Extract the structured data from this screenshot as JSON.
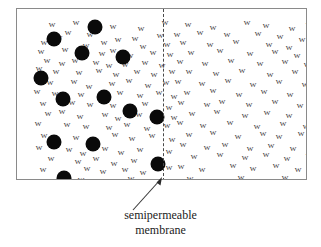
{
  "figure": {
    "name": "osmosis-semipermeable-membrane-diagram",
    "caption_line1": "semipermeable",
    "caption_line2": "membrane",
    "colors": {
      "vessel_border": "#8a8a8a",
      "membrane_line": "#4a4a4a",
      "solute_fill": "#0a0a0a",
      "water_text": "#2b2b2b",
      "background": "#ffffff",
      "caption_text": "#1c1c1c"
    },
    "vessel": {
      "x": 16,
      "y": 8,
      "width": 291,
      "height": 172
    },
    "membrane": {
      "x": 146,
      "style": "dashed",
      "orientation": "vertical"
    },
    "water_label": "W",
    "left_chamber": {
      "label": "concentrated solution side",
      "solute_count": 15,
      "water_count": 75
    },
    "right_chamber": {
      "label": "pure water side",
      "solute_count": 0,
      "water_count": 85
    },
    "solutes": [
      {
        "x": 78,
        "y": 18,
        "r": 7.5
      },
      {
        "x": 37,
        "y": 30,
        "r": 7.5
      },
      {
        "x": 65,
        "y": 44,
        "r": 7.5
      },
      {
        "x": 106,
        "y": 48,
        "r": 7.5
      },
      {
        "x": 24,
        "y": 69,
        "r": 7.5
      },
      {
        "x": 46,
        "y": 90,
        "r": 7.5
      },
      {
        "x": 87,
        "y": 88,
        "r": 7.5
      },
      {
        "x": 113,
        "y": 102,
        "r": 7.5
      },
      {
        "x": 140,
        "y": 108,
        "r": 7.5
      },
      {
        "x": 37,
        "y": 133,
        "r": 7.5
      },
      {
        "x": 76,
        "y": 135,
        "r": 7.5
      },
      {
        "x": 141,
        "y": 155,
        "r": 7.5
      },
      {
        "x": 47,
        "y": 169,
        "r": 7.5
      }
    ],
    "waters_left": [
      {
        "x": 35,
        "y": 16
      },
      {
        "x": 59,
        "y": 14
      },
      {
        "x": 96,
        "y": 18
      },
      {
        "x": 124,
        "y": 20
      },
      {
        "x": 148,
        "y": 14
      },
      {
        "x": 51,
        "y": 24
      },
      {
        "x": 42,
        "y": 29
      },
      {
        "x": 73,
        "y": 26
      },
      {
        "x": 118,
        "y": 30
      },
      {
        "x": 143,
        "y": 27
      },
      {
        "x": 27,
        "y": 34
      },
      {
        "x": 87,
        "y": 34
      },
      {
        "x": 101,
        "y": 31
      },
      {
        "x": 126,
        "y": 38
      },
      {
        "x": 150,
        "y": 36
      },
      {
        "x": 24,
        "y": 43
      },
      {
        "x": 48,
        "y": 41
      },
      {
        "x": 69,
        "y": 37
      },
      {
        "x": 85,
        "y": 45
      },
      {
        "x": 96,
        "y": 42
      },
      {
        "x": 113,
        "y": 47
      },
      {
        "x": 136,
        "y": 44
      },
      {
        "x": 153,
        "y": 46
      },
      {
        "x": 30,
        "y": 52
      },
      {
        "x": 45,
        "y": 55
      },
      {
        "x": 58,
        "y": 52
      },
      {
        "x": 79,
        "y": 54
      },
      {
        "x": 92,
        "y": 57
      },
      {
        "x": 108,
        "y": 56
      },
      {
        "x": 128,
        "y": 54
      },
      {
        "x": 145,
        "y": 57
      },
      {
        "x": 22,
        "y": 60
      },
      {
        "x": 39,
        "y": 63
      },
      {
        "x": 62,
        "y": 64
      },
      {
        "x": 82,
        "y": 62
      },
      {
        "x": 99,
        "y": 66
      },
      {
        "x": 120,
        "y": 63
      },
      {
        "x": 137,
        "y": 66
      },
      {
        "x": 155,
        "y": 63
      },
      {
        "x": 33,
        "y": 74
      },
      {
        "x": 57,
        "y": 73
      },
      {
        "x": 72,
        "y": 78
      },
      {
        "x": 95,
        "y": 75
      },
      {
        "x": 112,
        "y": 72
      },
      {
        "x": 131,
        "y": 77
      },
      {
        "x": 149,
        "y": 74
      },
      {
        "x": 20,
        "y": 83
      },
      {
        "x": 38,
        "y": 85
      },
      {
        "x": 64,
        "y": 86
      },
      {
        "x": 103,
        "y": 84
      },
      {
        "x": 123,
        "y": 87
      },
      {
        "x": 142,
        "y": 84
      },
      {
        "x": 157,
        "y": 88
      },
      {
        "x": 26,
        "y": 95
      },
      {
        "x": 55,
        "y": 94
      },
      {
        "x": 73,
        "y": 96
      },
      {
        "x": 96,
        "y": 97
      },
      {
        "x": 128,
        "y": 95
      },
      {
        "x": 152,
        "y": 99
      },
      {
        "x": 31,
        "y": 105
      },
      {
        "x": 45,
        "y": 103
      },
      {
        "x": 63,
        "y": 108
      },
      {
        "x": 88,
        "y": 106
      },
      {
        "x": 101,
        "y": 110
      },
      {
        "x": 122,
        "y": 106
      },
      {
        "x": 157,
        "y": 109
      },
      {
        "x": 21,
        "y": 115
      },
      {
        "x": 50,
        "y": 116
      },
      {
        "x": 69,
        "y": 118
      },
      {
        "x": 92,
        "y": 119
      },
      {
        "x": 110,
        "y": 116
      },
      {
        "x": 130,
        "y": 120
      },
      {
        "x": 150,
        "y": 117
      },
      {
        "x": 27,
        "y": 127
      },
      {
        "x": 59,
        "y": 129
      },
      {
        "x": 98,
        "y": 126
      },
      {
        "x": 115,
        "y": 130
      },
      {
        "x": 135,
        "y": 127
      },
      {
        "x": 155,
        "y": 131
      },
      {
        "x": 22,
        "y": 139
      },
      {
        "x": 52,
        "y": 141
      },
      {
        "x": 66,
        "y": 145
      },
      {
        "x": 88,
        "y": 140
      },
      {
        "x": 104,
        "y": 144
      },
      {
        "x": 123,
        "y": 141
      },
      {
        "x": 152,
        "y": 143
      },
      {
        "x": 34,
        "y": 150
      },
      {
        "x": 61,
        "y": 153
      },
      {
        "x": 79,
        "y": 150
      },
      {
        "x": 97,
        "y": 155
      },
      {
        "x": 117,
        "y": 152
      },
      {
        "x": 26,
        "y": 161
      },
      {
        "x": 70,
        "y": 160
      },
      {
        "x": 86,
        "y": 163
      },
      {
        "x": 108,
        "y": 161
      },
      {
        "x": 126,
        "y": 164
      },
      {
        "x": 152,
        "y": 159
      },
      {
        "x": 35,
        "y": 172
      },
      {
        "x": 64,
        "y": 171
      },
      {
        "x": 92,
        "y": 172
      },
      {
        "x": 114,
        "y": 170
      },
      {
        "x": 137,
        "y": 173
      }
    ],
    "waters_right": [
      {
        "x": 171,
        "y": 16
      },
      {
        "x": 196,
        "y": 19
      },
      {
        "x": 230,
        "y": 14
      },
      {
        "x": 249,
        "y": 17
      },
      {
        "x": 275,
        "y": 20
      },
      {
        "x": 292,
        "y": 16
      },
      {
        "x": 160,
        "y": 26
      },
      {
        "x": 183,
        "y": 24
      },
      {
        "x": 210,
        "y": 26
      },
      {
        "x": 241,
        "y": 25
      },
      {
        "x": 263,
        "y": 28
      },
      {
        "x": 285,
        "y": 31
      },
      {
        "x": 301,
        "y": 24
      },
      {
        "x": 166,
        "y": 34
      },
      {
        "x": 193,
        "y": 36
      },
      {
        "x": 219,
        "y": 33
      },
      {
        "x": 252,
        "y": 36
      },
      {
        "x": 272,
        "y": 39
      },
      {
        "x": 296,
        "y": 37
      },
      {
        "x": 174,
        "y": 44
      },
      {
        "x": 203,
        "y": 42
      },
      {
        "x": 233,
        "y": 45
      },
      {
        "x": 258,
        "y": 43
      },
      {
        "x": 280,
        "y": 47
      },
      {
        "x": 303,
        "y": 45
      },
      {
        "x": 163,
        "y": 53
      },
      {
        "x": 188,
        "y": 55
      },
      {
        "x": 214,
        "y": 52
      },
      {
        "x": 243,
        "y": 55
      },
      {
        "x": 268,
        "y": 53
      },
      {
        "x": 290,
        "y": 56
      },
      {
        "x": 172,
        "y": 63
      },
      {
        "x": 199,
        "y": 65
      },
      {
        "x": 225,
        "y": 62
      },
      {
        "x": 253,
        "y": 66
      },
      {
        "x": 278,
        "y": 63
      },
      {
        "x": 300,
        "y": 66
      },
      {
        "x": 161,
        "y": 73
      },
      {
        "x": 185,
        "y": 75
      },
      {
        "x": 211,
        "y": 72
      },
      {
        "x": 236,
        "y": 76
      },
      {
        "x": 262,
        "y": 73
      },
      {
        "x": 288,
        "y": 76
      },
      {
        "x": 170,
        "y": 84
      },
      {
        "x": 196,
        "y": 82
      },
      {
        "x": 222,
        "y": 86
      },
      {
        "x": 247,
        "y": 83
      },
      {
        "x": 273,
        "y": 86
      },
      {
        "x": 297,
        "y": 84
      },
      {
        "x": 164,
        "y": 94
      },
      {
        "x": 190,
        "y": 96
      },
      {
        "x": 205,
        "y": 93
      },
      {
        "x": 232,
        "y": 96
      },
      {
        "x": 258,
        "y": 93
      },
      {
        "x": 283,
        "y": 97
      },
      {
        "x": 303,
        "y": 94
      },
      {
        "x": 175,
        "y": 105
      },
      {
        "x": 200,
        "y": 103
      },
      {
        "x": 228,
        "y": 107
      },
      {
        "x": 250,
        "y": 104
      },
      {
        "x": 272,
        "y": 107
      },
      {
        "x": 295,
        "y": 104
      },
      {
        "x": 163,
        "y": 114
      },
      {
        "x": 186,
        "y": 117
      },
      {
        "x": 213,
        "y": 114
      },
      {
        "x": 240,
        "y": 118
      },
      {
        "x": 266,
        "y": 115
      },
      {
        "x": 289,
        "y": 118
      },
      {
        "x": 306,
        "y": 114
      },
      {
        "x": 172,
        "y": 126
      },
      {
        "x": 196,
        "y": 124
      },
      {
        "x": 221,
        "y": 128
      },
      {
        "x": 246,
        "y": 125
      },
      {
        "x": 262,
        "y": 128
      },
      {
        "x": 284,
        "y": 125
      },
      {
        "x": 302,
        "y": 129
      },
      {
        "x": 166,
        "y": 136
      },
      {
        "x": 190,
        "y": 139
      },
      {
        "x": 208,
        "y": 136
      },
      {
        "x": 233,
        "y": 140
      },
      {
        "x": 254,
        "y": 137
      },
      {
        "x": 276,
        "y": 140
      },
      {
        "x": 298,
        "y": 137
      },
      {
        "x": 177,
        "y": 148
      },
      {
        "x": 203,
        "y": 146
      },
      {
        "x": 228,
        "y": 149
      },
      {
        "x": 249,
        "y": 146
      },
      {
        "x": 270,
        "y": 150
      },
      {
        "x": 292,
        "y": 147
      },
      {
        "x": 164,
        "y": 158
      },
      {
        "x": 185,
        "y": 161
      },
      {
        "x": 216,
        "y": 157
      },
      {
        "x": 236,
        "y": 160
      },
      {
        "x": 259,
        "y": 157
      },
      {
        "x": 281,
        "y": 161
      },
      {
        "x": 303,
        "y": 158
      },
      {
        "x": 173,
        "y": 170
      },
      {
        "x": 197,
        "y": 172
      },
      {
        "x": 224,
        "y": 169
      },
      {
        "x": 245,
        "y": 172
      },
      {
        "x": 268,
        "y": 169
      },
      {
        "x": 290,
        "y": 172
      }
    ]
  }
}
